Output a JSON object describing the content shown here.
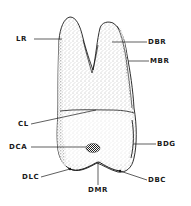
{
  "diagram": {
    "colors": {
      "ink": "#1a1a1a",
      "stipple": "#6b6b6b",
      "background": "#ffffff"
    },
    "labels": [
      {
        "id": "LR",
        "text": "LR"
      },
      {
        "id": "DBR",
        "text": "DBR"
      },
      {
        "id": "MBR",
        "text": "MBR"
      },
      {
        "id": "CL",
        "text": "CL"
      },
      {
        "id": "DCA",
        "text": "DCA"
      },
      {
        "id": "BDG",
        "text": "BDG"
      },
      {
        "id": "DLC",
        "text": "DLC"
      },
      {
        "id": "DBC",
        "text": "DBC"
      },
      {
        "id": "DMR",
        "text": "DMR"
      }
    ]
  }
}
